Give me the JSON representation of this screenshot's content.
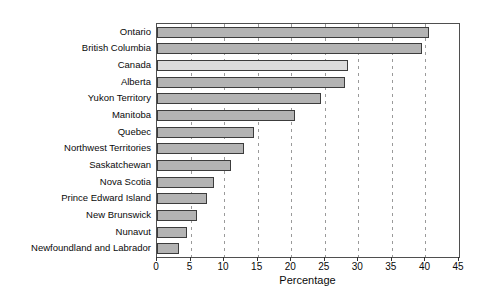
{
  "chart_data": {
    "type": "bar",
    "orientation": "horizontal",
    "title": "",
    "xlabel": "Percentage",
    "ylabel": "",
    "xlim": [
      0,
      45
    ],
    "xticks": [
      0,
      5,
      10,
      15,
      20,
      25,
      30,
      35,
      40,
      45
    ],
    "grid": "vertical dashed gridlines at each x tick, drawn behind bars",
    "legend": "none",
    "categories": [
      "Ontario",
      "British Columbia",
      "Canada",
      "Alberta",
      "Yukon Territory",
      "Manitoba",
      "Quebec",
      "Northwest Territories",
      "Saskatchewan",
      "Nova Scotia",
      "Prince Edward Island",
      "New Brunswick",
      "Nunavut",
      "Newfoundland and Labrador"
    ],
    "values": [
      40.5,
      39.5,
      28.5,
      28,
      24.5,
      20.5,
      14.5,
      13,
      11,
      8.5,
      7.5,
      6,
      4.5,
      3.3
    ],
    "highlight_category": "Canada",
    "colors": {
      "bar_fill": "#b3b3b3",
      "highlight_fill": "#dcdcdc",
      "bar_border": "#3c3c3c",
      "gridline": "#9a9a9a",
      "axis_box": "#4f4f4f",
      "background": "#ffffff"
    }
  }
}
